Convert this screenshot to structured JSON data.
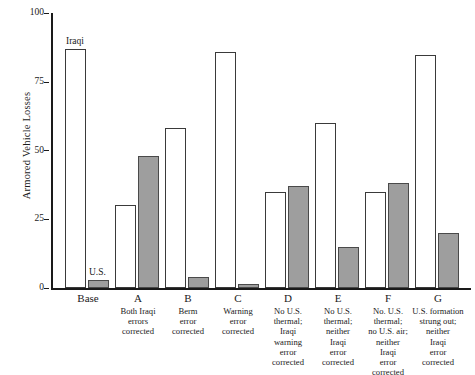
{
  "chart_data": {
    "type": "bar",
    "title": "",
    "subtitle": "",
    "xlabel": "",
    "ylabel": "Armored Vehicle Losses",
    "ylim": [
      0,
      100
    ],
    "yticks": [
      "0",
      "25",
      "50",
      "75",
      "100"
    ],
    "grid": false,
    "legend_position": "inline-annotation",
    "categories": [
      "Base",
      "A",
      "B",
      "C",
      "D",
      "E",
      "F",
      "G"
    ],
    "category_descriptions": [
      "",
      "Both Iraqi errors corrected",
      "Berm error corrected",
      "Warning error corrected",
      "No U.S. thermal; Iraqi warning error corrected",
      "No U.S. thermal; neither Iraqi error corrected",
      "No. U.S. thermal; no U.S. air; neither Iraqi error corrected",
      "U.S. formation strung out; neither Iraqi error corrected"
    ],
    "series": [
      {
        "name": "Iraqi",
        "fill": "#ffffff",
        "values": [
          87,
          30,
          58,
          86,
          35,
          60,
          35,
          85
        ]
      },
      {
        "name": "U.S.",
        "fill": "#9e9e9e",
        "values": [
          3,
          48,
          4,
          1,
          37,
          15,
          38,
          20
        ]
      }
    ],
    "annotations": [
      {
        "text": "Iraqi",
        "series": "Iraqi",
        "category": "Base"
      },
      {
        "text": "U.S.",
        "series": "U.S.",
        "category": "Base"
      }
    ]
  },
  "axis": {
    "y_title": "Armored Vehicle Losses",
    "y_ticks": [
      {
        "label": "100",
        "value": 100
      },
      {
        "label": "75",
        "value": 75
      },
      {
        "label": "50",
        "value": 50
      },
      {
        "label": "25",
        "value": 25
      },
      {
        "label": "0",
        "value": 0
      }
    ]
  },
  "x_categories": [
    {
      "key": "Base",
      "desc": ""
    },
    {
      "key": "A",
      "desc": "Both Iraqi\nerrors\ncorrected"
    },
    {
      "key": "B",
      "desc": "Berm\nerror\ncorrected"
    },
    {
      "key": "C",
      "desc": "Warning\nerror\ncorrected"
    },
    {
      "key": "D",
      "desc": "No U.S.\nthermal;\nIraqi\nwarning\nerror\ncorrected"
    },
    {
      "key": "E",
      "desc": "No U.S.\nthermal;\nneither\nIraqi\nerror\ncorrected"
    },
    {
      "key": "F",
      "desc": "No. U.S.\nthermal;\nno U.S. air;\nneither\nIraqi\nerror\ncorrected"
    },
    {
      "key": "G",
      "desc": "U.S. formation\nstrung out;\nneither\nIraqi\nerror\ncorrected"
    }
  ],
  "annotations": {
    "iraqi_label": "Iraqi",
    "us_label": "U.S."
  },
  "colors": {
    "iraqi_fill": "#ffffff",
    "us_fill": "#9e9e9e",
    "bar_border": "#3a3a3a",
    "axis": "#1a1a1a"
  }
}
